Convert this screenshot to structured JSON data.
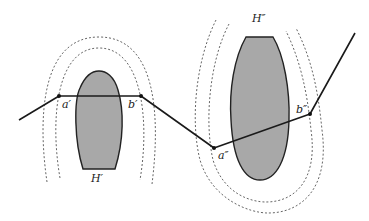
{
  "diagram": {
    "type": "path-around-obstacles",
    "colors": {
      "background": "#ffffff",
      "obstacle_fill": "#a8a8a8",
      "outline": "#222222",
      "dashed": "#666666",
      "path": "#1a1a1a"
    },
    "obstacles": [
      {
        "id": "H1",
        "label": "H′"
      },
      {
        "id": "H2",
        "label": "H″"
      }
    ],
    "points": [
      {
        "id": "a1",
        "label": "a′"
      },
      {
        "id": "b1",
        "label": "b′"
      },
      {
        "id": "a2",
        "label": "a″"
      },
      {
        "id": "b2",
        "label": "b″"
      }
    ],
    "path_vertices": [
      [
        19,
        120
      ],
      [
        59,
        96
      ],
      [
        141,
        96
      ],
      [
        214,
        148
      ],
      [
        310,
        114
      ],
      [
        355,
        33
      ]
    ]
  }
}
